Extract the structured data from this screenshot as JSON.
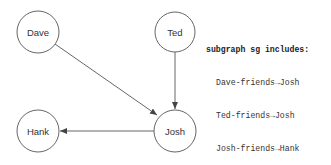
{
  "diagram": {
    "nodes": [
      {
        "id": "dave",
        "label": "Dave",
        "cx": 38,
        "cy": 32,
        "r": 21
      },
      {
        "id": "ted",
        "label": "Ted",
        "cx": 175,
        "cy": 32,
        "r": 20
      },
      {
        "id": "hank",
        "label": "Hank",
        "cx": 38,
        "cy": 131,
        "r": 21
      },
      {
        "id": "josh",
        "label": "Josh",
        "cx": 175,
        "cy": 131,
        "r": 21
      }
    ],
    "edges": [
      {
        "from": "Dave",
        "to": "Josh",
        "label": "friends"
      },
      {
        "from": "Ted",
        "to": "Josh",
        "label": "friends"
      },
      {
        "from": "Josh",
        "to": "Hank",
        "label": "friends"
      }
    ]
  },
  "legend": {
    "title": "subgraph sg includes:",
    "items": [
      "Dave-friends→Josh",
      "Ted-friends→Josh",
      "Josh-friends→Hank"
    ]
  }
}
